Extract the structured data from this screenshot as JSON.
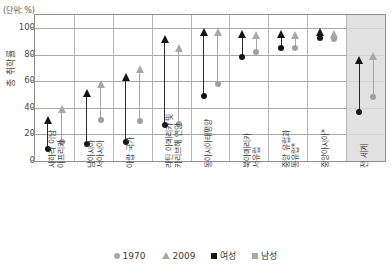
{
  "unit_note": "(단위: %)",
  "y_axis_title": "총 취학률",
  "legend": [
    {
      "icon": "circle-marker-icon",
      "label": "1970"
    },
    {
      "icon": "triangle-marker-icon",
      "label": "2009"
    },
    {
      "icon": "square-marker-icon",
      "label": "여성"
    },
    {
      "icon": "square-marker-icon",
      "label": "남성"
    }
  ],
  "chart_data": {
    "type": "scatter",
    "title": "",
    "xlabel": "",
    "ylabel": "총 취학률",
    "ylim": [
      0,
      110
    ],
    "yticks": [
      0,
      20,
      40,
      60,
      80,
      100
    ],
    "grid": true,
    "legend_position": "bottom",
    "categories": [
      "사하라 이남 아프리카",
      "남아시아 서아시아",
      "아랍 국가",
      "라틴 아메리카 및 카리브해 연안",
      "동아시아태평양",
      "북아메리카 서유럽",
      "중앙 유럽과 동유럽*",
      "중앙아시아*",
      "전 세계"
    ],
    "highlight_category": "전 세계",
    "series": [
      {
        "name": "여성 1970",
        "marker": "circle",
        "color": "#141414",
        "values": [
          9,
          13,
          14,
          27,
          49,
          78,
          85,
          93,
          37
        ]
      },
      {
        "name": "여성 2009",
        "marker": "triangle",
        "color": "#141414",
        "values": [
          31,
          51,
          63,
          92,
          97,
          96,
          96,
          97,
          76
        ]
      },
      {
        "name": "남성 1970",
        "marker": "circle",
        "color": "#a0a0a0",
        "values": [
          14,
          31,
          30,
          28,
          58,
          82,
          85,
          92,
          48
        ]
      },
      {
        "name": "남성 2009",
        "marker": "triangle",
        "color": "#a8a8a8",
        "values": [
          39,
          58,
          69,
          85,
          97,
          95,
          95,
          96,
          79
        ]
      }
    ]
  }
}
